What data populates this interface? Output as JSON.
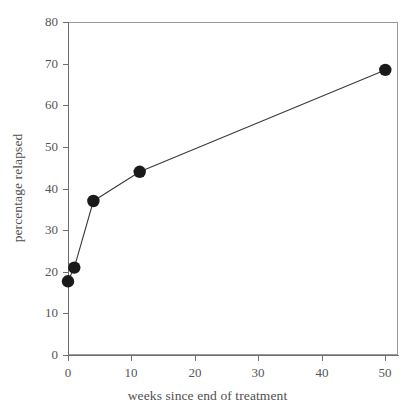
{
  "chart_data": {
    "type": "line",
    "title": "",
    "subtitle": "",
    "xlabel": "weeks since end of treatment",
    "ylabel": "percentage relapsed",
    "xlim": [
      0,
      52
    ],
    "ylim": [
      0,
      80
    ],
    "xticks": [
      0,
      10,
      20,
      30,
      40,
      50
    ],
    "xtick_labels": [
      "0",
      "10",
      "20",
      "30",
      "40",
      "50"
    ],
    "yticks": [
      0,
      10,
      20,
      30,
      40,
      50,
      60,
      70,
      80
    ],
    "ytick_labels": [
      "0",
      "10",
      "20",
      "30",
      "40",
      "50",
      "60",
      "70",
      "80"
    ],
    "grid": false,
    "legend": null,
    "legend_position": "none",
    "marker": "filled-circle",
    "marker_color": "#1a1a1a",
    "line_color": "#3a3a3a",
    "series": [
      {
        "name": "percentage relapsed",
        "x": [
          0,
          1,
          4,
          11.3,
          50
        ],
        "y": [
          17.7,
          21,
          37,
          44,
          68.5
        ],
        "points": [
          {
            "x": 0,
            "y": 17.7
          },
          {
            "x": 1,
            "y": 21
          },
          {
            "x": 4,
            "y": 37
          },
          {
            "x": 11.3,
            "y": 44
          },
          {
            "x": 50,
            "y": 68.5
          }
        ]
      }
    ],
    "annotations": []
  },
  "figure": {
    "background_color": "#ffffff",
    "axis_color": "#6e6e6e",
    "text_color": "#4f4f4f"
  }
}
